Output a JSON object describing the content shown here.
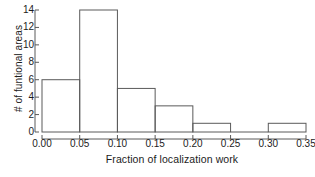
{
  "chart_data": {
    "type": "bar",
    "subtype": "histogram",
    "title": "",
    "xlabel": "Fraction of localization work",
    "ylabel": "# of funtional areas",
    "categories": [
      "0.00-0.05",
      "0.05-0.10",
      "0.10-0.15",
      "0.15-0.20",
      "0.20-0.25",
      "0.25-0.30",
      "0.30-0.35"
    ],
    "bin_edges": [
      0.0,
      0.05,
      0.1,
      0.15,
      0.2,
      0.25,
      0.3,
      0.35
    ],
    "bin_width": 0.05,
    "values": [
      6,
      14,
      5,
      3,
      1,
      0,
      1
    ],
    "xlim": [
      0.0,
      0.35
    ],
    "ylim": [
      0,
      14
    ],
    "xticks": [
      0.0,
      0.05,
      0.1,
      0.15,
      0.2,
      0.25,
      0.3,
      0.35
    ],
    "xtick_labels": [
      "0.00",
      "0.05",
      "0.10",
      "0.15",
      "0.20",
      "0.25",
      "0.30",
      "0.35"
    ],
    "yticks": [
      0,
      2,
      4,
      6,
      8,
      10,
      12,
      14
    ],
    "ytick_labels": [
      "0",
      "2",
      "4",
      "6",
      "8",
      "10",
      "12",
      "14"
    ],
    "grid": false,
    "legend": false,
    "bar_fill": "none",
    "bar_edge_color": "#5a5a5a",
    "axis_color": "#5a5a5a",
    "text_color": "#1c1c1c",
    "background": "#ffffff"
  },
  "caption_remnant": "",
  "axis_titles": {
    "x": "Fraction of localization work",
    "y": "# of funtional areas"
  }
}
